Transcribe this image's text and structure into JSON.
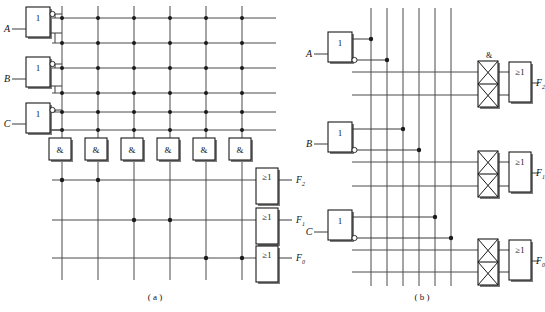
{
  "figure": {
    "type": "pla-logic-diagram",
    "panels": [
      {
        "id": "a",
        "caption": "( a )",
        "description": "PLA with AND plane dot-matrix and OR plane dot-matrix",
        "inputs": [
          {
            "label": "A",
            "inverter_label": "1"
          },
          {
            "label": "B",
            "inverter_label": "1"
          },
          {
            "label": "C",
            "inverter_label": "1"
          }
        ],
        "and_gates": [
          {
            "label": "&"
          },
          {
            "label": "&"
          },
          {
            "label": "&"
          },
          {
            "label": "&"
          },
          {
            "label": "&"
          },
          {
            "label": "&"
          }
        ],
        "or_gates": [
          {
            "label": "≥1",
            "output": "F",
            "subscript": "2"
          },
          {
            "label": "≥1",
            "output": "F",
            "subscript": "1"
          },
          {
            "label": "≥1",
            "output": "F",
            "subscript": "0"
          }
        ],
        "and_plane_matrix": [
          [
            1,
            1,
            1,
            1,
            1,
            1
          ],
          [
            1,
            1,
            1,
            1,
            1,
            1
          ],
          [
            1,
            1,
            1,
            1,
            1,
            1
          ],
          [
            1,
            1,
            1,
            1,
            1,
            1
          ],
          [
            1,
            1,
            1,
            1,
            1,
            1
          ],
          [
            1,
            1,
            1,
            1,
            1,
            1
          ]
        ],
        "or_plane_matrix": [
          [
            1,
            1,
            0,
            0,
            0,
            0
          ],
          [
            0,
            0,
            1,
            1,
            0,
            0
          ],
          [
            0,
            0,
            0,
            0,
            1,
            1
          ]
        ]
      },
      {
        "id": "b",
        "caption": "( b )",
        "description": "Equivalent PLA drawn with crossed-cell AND arrays feeding OR gates",
        "inputs": [
          {
            "label": "A",
            "inverter_label": "1"
          },
          {
            "label": "B",
            "inverter_label": "1"
          },
          {
            "label": "C",
            "inverter_label": "1"
          }
        ],
        "and_array_label": "&",
        "and_arrays": [
          {
            "cells": [
              "x",
              "x"
            ]
          },
          {
            "cells": [
              "x",
              "x"
            ]
          },
          {
            "cells": [
              "x",
              "x"
            ]
          }
        ],
        "or_gates": [
          {
            "label": "≥1",
            "output": "F",
            "subscript": "2"
          },
          {
            "label": "≥1",
            "output": "F",
            "subscript": "1"
          },
          {
            "label": "≥1",
            "output": "F",
            "subscript": "0"
          }
        ],
        "vertical_line_count": 6,
        "input_connections": [
          {
            "signal": "A",
            "line": 1
          },
          {
            "signal": "A'",
            "line": 2
          },
          {
            "signal": "B",
            "line": 3
          },
          {
            "signal": "B'",
            "line": 4
          },
          {
            "signal": "C",
            "line": 5
          },
          {
            "signal": "C'",
            "line": 6
          }
        ]
      }
    ],
    "colors": {
      "wire": "#4a4a4a",
      "box_stroke": "#1a1a1a",
      "box_shadow": "#7d7d7d",
      "dot": "#1b1b1b",
      "background": "#ffffff",
      "text": "#111111"
    }
  }
}
